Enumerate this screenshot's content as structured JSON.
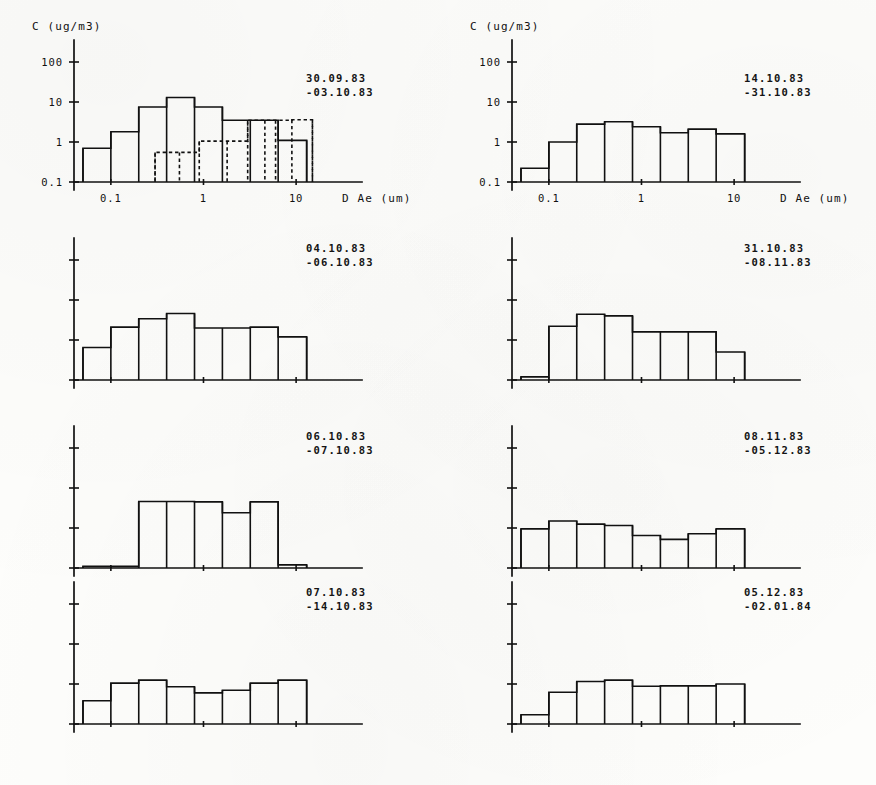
{
  "figure": {
    "axis": {
      "y_title": "C (ug/m3)",
      "x_title": "D Ae (um)",
      "y_ticks": [
        "0.1",
        "1",
        "10",
        "100"
      ],
      "x_ticks": [
        "0.1",
        "1",
        "10"
      ]
    },
    "panels": [
      {
        "id": "panel-1",
        "date_from": "30.09.83",
        "date_to": "-03.10.83",
        "show_axis_labels": true
      },
      {
        "id": "panel-2",
        "date_from": "04.10.83",
        "date_to": "-06.10.83",
        "show_axis_labels": false
      },
      {
        "id": "panel-3",
        "date_from": "06.10.83",
        "date_to": "-07.10.83",
        "show_axis_labels": false
      },
      {
        "id": "panel-4",
        "date_from": "07.10.83",
        "date_to": "-14.10.83",
        "show_axis_labels": false
      },
      {
        "id": "panel-5",
        "date_from": "14.10.83",
        "date_to": "-31.10.83",
        "show_axis_labels": true
      },
      {
        "id": "panel-6",
        "date_from": "31.10.83",
        "date_to": "-08.11.83",
        "show_axis_labels": false
      },
      {
        "id": "panel-7",
        "date_from": "08.11.83",
        "date_to": "-05.12.83",
        "show_axis_labels": false
      },
      {
        "id": "panel-8",
        "date_from": "05.12.83",
        "date_to": "-02.01.84",
        "show_axis_labels": false
      }
    ]
  },
  "chart_data": [
    {
      "type": "bar",
      "title": "30.09.83 -03.10.83",
      "xlabel": "D Ae (um)",
      "ylabel": "C (ug/m3)",
      "xscale": "log",
      "yscale": "log",
      "xlim": [
        0.04,
        20
      ],
      "ylim": [
        0.1,
        100
      ],
      "xtick_labels": [
        "0.1",
        "1",
        "10"
      ],
      "ytick_labels": [
        "0.1",
        "1",
        "10",
        "100"
      ],
      "grid": false,
      "legend": "none",
      "bin_edges": [
        0.05,
        0.1,
        0.2,
        0.4,
        0.8,
        1.6,
        3.2,
        6.4,
        13.0
      ],
      "series": [
        {
          "name": "solid",
          "linestyle": "solid",
          "values": [
            0.7,
            1.8,
            7.5,
            13.0,
            7.5,
            3.5,
            3.5,
            1.1
          ]
        },
        {
          "name": "dashed",
          "linestyle": "dashed",
          "bin_edges": [
            0.3,
            0.55,
            0.9,
            1.8,
            3.0,
            4.6,
            6.0,
            9.0,
            15.0
          ],
          "values": [
            0.55,
            0.55,
            1.05,
            1.05,
            3.5,
            3.5,
            3.5,
            3.6
          ]
        }
      ]
    },
    {
      "type": "bar",
      "title": "04.10.83 -06.10.83",
      "xlabel": "",
      "ylabel": "",
      "xscale": "log",
      "yscale": "log",
      "xlim": [
        0.04,
        20
      ],
      "ylim": [
        0.1,
        100
      ],
      "grid": false,
      "legend": "none",
      "bin_edges": [
        0.05,
        0.1,
        0.2,
        0.4,
        0.8,
        1.6,
        3.2,
        6.4,
        13.0
      ],
      "series": [
        {
          "name": "solid",
          "linestyle": "solid",
          "values": [
            0.65,
            2.1,
            3.4,
            4.6,
            2.0,
            2.0,
            2.1,
            1.2
          ]
        }
      ]
    },
    {
      "type": "bar",
      "title": "06.10.83 -07.10.83",
      "xlabel": "",
      "ylabel": "",
      "xscale": "log",
      "yscale": "log",
      "xlim": [
        0.04,
        20
      ],
      "ylim": [
        0.1,
        100
      ],
      "grid": false,
      "legend": "none",
      "bin_edges": [
        0.05,
        0.1,
        0.2,
        0.4,
        0.8,
        1.6,
        3.2,
        6.4,
        13.0
      ],
      "series": [
        {
          "name": "solid",
          "linestyle": "solid",
          "values": [
            0.11,
            0.11,
            4.6,
            4.6,
            4.5,
            2.4,
            4.5,
            0.12
          ]
        }
      ]
    },
    {
      "type": "bar",
      "title": "07.10.83 -14.10.83",
      "xlabel": "",
      "ylabel": "",
      "xscale": "log",
      "yscale": "log",
      "xlim": [
        0.04,
        20
      ],
      "ylim": [
        0.1,
        100
      ],
      "grid": false,
      "legend": "none",
      "bin_edges": [
        0.05,
        0.1,
        0.2,
        0.4,
        0.8,
        1.6,
        3.2,
        6.4,
        13.0
      ],
      "series": [
        {
          "name": "solid",
          "linestyle": "solid",
          "values": [
            0.38,
            1.05,
            1.25,
            0.85,
            0.6,
            0.7,
            1.05,
            1.25
          ]
        }
      ]
    },
    {
      "type": "bar",
      "title": "14.10.83 -31.10.83",
      "xlabel": "D Ae (um)",
      "ylabel": "C (ug/m3)",
      "xscale": "log",
      "yscale": "log",
      "xlim": [
        0.04,
        20
      ],
      "ylim": [
        0.1,
        100
      ],
      "xtick_labels": [
        "0.1",
        "1",
        "10"
      ],
      "ytick_labels": [
        "0.1",
        "1",
        "10",
        "100"
      ],
      "grid": false,
      "legend": "none",
      "bin_edges": [
        0.05,
        0.1,
        0.2,
        0.4,
        0.8,
        1.6,
        3.2,
        6.4,
        13.0
      ],
      "series": [
        {
          "name": "solid",
          "linestyle": "solid",
          "values": [
            0.22,
            1.0,
            2.8,
            3.2,
            2.4,
            1.7,
            2.1,
            1.6
          ]
        }
      ]
    },
    {
      "type": "bar",
      "title": "31.10.83 -08.11.83",
      "xlabel": "",
      "ylabel": "",
      "xscale": "log",
      "yscale": "log",
      "xlim": [
        0.04,
        20
      ],
      "ylim": [
        0.1,
        100
      ],
      "grid": false,
      "legend": "none",
      "bin_edges": [
        0.05,
        0.1,
        0.2,
        0.4,
        0.8,
        1.6,
        3.2,
        6.4,
        13.0
      ],
      "series": [
        {
          "name": "solid",
          "linestyle": "solid",
          "values": [
            0.12,
            2.2,
            4.4,
            4.0,
            1.6,
            1.6,
            1.6,
            0.5
          ]
        }
      ]
    },
    {
      "type": "bar",
      "title": "08.11.83 -05.12.83",
      "xlabel": "",
      "ylabel": "",
      "xscale": "log",
      "yscale": "log",
      "xlim": [
        0.04,
        20
      ],
      "ylim": [
        0.1,
        100
      ],
      "grid": false,
      "legend": "none",
      "bin_edges": [
        0.05,
        0.1,
        0.2,
        0.4,
        0.8,
        1.6,
        3.2,
        6.4,
        13.0
      ],
      "series": [
        {
          "name": "solid",
          "linestyle": "solid",
          "values": [
            0.95,
            1.5,
            1.25,
            1.15,
            0.65,
            0.52,
            0.72,
            0.95
          ]
        }
      ]
    },
    {
      "type": "bar",
      "title": "05.12.83 -02.01.84",
      "xlabel": "",
      "ylabel": "",
      "xscale": "log",
      "yscale": "log",
      "xlim": [
        0.04,
        20
      ],
      "ylim": [
        0.1,
        100
      ],
      "grid": false,
      "legend": "none",
      "bin_edges": [
        0.05,
        0.1,
        0.2,
        0.4,
        0.8,
        1.6,
        3.2,
        6.4,
        13.0
      ],
      "series": [
        {
          "name": "solid",
          "linestyle": "solid",
          "values": [
            0.17,
            0.62,
            1.15,
            1.25,
            0.88,
            0.9,
            0.9,
            1.0
          ]
        }
      ]
    }
  ]
}
